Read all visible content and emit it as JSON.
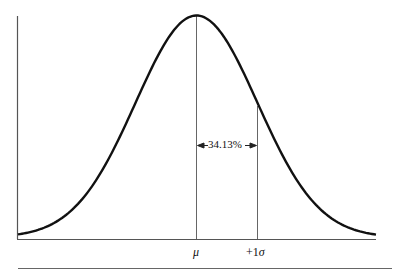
{
  "chart_data": {
    "type": "line",
    "xlabel": "",
    "ylabel": "",
    "curve": "gaussian",
    "tick_labels": [
      "μ",
      "+1σ"
    ],
    "annotations": [
      {
        "text": "34.13%",
        "between": [
          "μ",
          "+1σ"
        ],
        "style": "double-arrow"
      }
    ],
    "vertical_lines": [
      {
        "at": "μ",
        "to": "peak"
      },
      {
        "at": "+1σ",
        "to": "curve"
      }
    ],
    "grid": false,
    "legend": null
  },
  "labels": {
    "mu": "μ",
    "plus_sigma_prefix": "+1",
    "sigma": "σ",
    "percent": "34.13%"
  },
  "colors": {
    "curve": "#111111",
    "axis": "#555555",
    "lines": "#666666"
  }
}
